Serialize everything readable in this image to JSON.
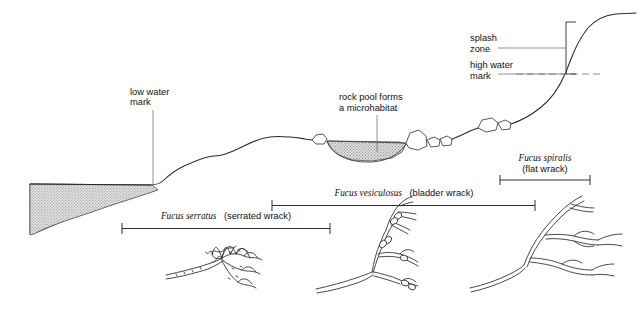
{
  "figure": {
    "background_color": "#ffffff",
    "ink_color": "#1a1a1a",
    "water_fill_color": "#d0d0d0",
    "pool_fill_color": "#c9c9c9"
  },
  "labels": {
    "low_water": {
      "line1": "low water",
      "line2": "mark"
    },
    "rock_pool": {
      "line1": "rock pool forms",
      "line2": "a microhabitat"
    },
    "splash_zone": {
      "line1": "splash",
      "line2": "zone"
    },
    "high_water": {
      "line1": "high water",
      "line2": "mark"
    }
  },
  "zones": [
    {
      "id": "fucus-serratus",
      "scientific_name": "Fucus serratus",
      "common_name": "(serrated wrack)",
      "bar": {
        "x1": 122,
        "x2": 330,
        "y": 228
      },
      "label_x": 226,
      "label_y": 219
    },
    {
      "id": "fucus-vesiculosus",
      "scientific_name": "Fucus vesiculosus",
      "common_name": "(bladder wrack)",
      "bar": {
        "x1": 272,
        "x2": 535,
        "y": 205
      },
      "label_x": 404,
      "label_y": 196
    },
    {
      "id": "fucus-spiralis",
      "scientific_name": "Fucus spiralis",
      "common_name": "(flat wrack)",
      "bar": {
        "x1": 500,
        "x2": 590,
        "y": 180
      },
      "label_x": 545,
      "label_y": 161,
      "label_line2_y": 172
    }
  ],
  "specimens": [
    {
      "id": "serrated-wrack-drawing",
      "name": "serrated wrack frond",
      "has_bladders": false
    },
    {
      "id": "bladder-wrack-drawing",
      "name": "bladder wrack frond",
      "has_bladders": true
    },
    {
      "id": "flat-wrack-drawing",
      "name": "flat wrack frond",
      "has_bladders": false
    }
  ]
}
